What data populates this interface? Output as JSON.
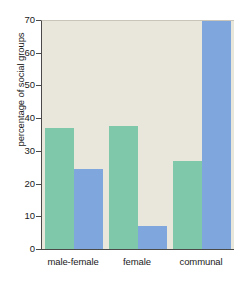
{
  "chart_data": {
    "type": "bar",
    "title": "",
    "xlabel": "",
    "ylabel": "percentage of social groups",
    "categories": [
      "male-female",
      "female",
      "communal"
    ],
    "ylim": [
      0,
      70
    ],
    "yticks": [
      0,
      10,
      20,
      30,
      40,
      50,
      60,
      70
    ],
    "ytick_labels": [
      "0",
      "10",
      "20",
      "30",
      "40",
      "50",
      "60",
      "70"
    ],
    "grid": false,
    "legend": "none",
    "series": [
      {
        "name": "green-series",
        "color": "#7fc8a9",
        "values": [
          37.3,
          37.9,
          27.2
        ]
      },
      {
        "name": "blue-series",
        "color": "#7fa7dd",
        "values": [
          24.8,
          7.3,
          70.0
        ]
      }
    ],
    "colors": {
      "plot_background": "#e9e6dc",
      "page_background": "#ffffff",
      "axis": "#4a4a48",
      "text": "#1a1a1a",
      "green": "#7fc8a9",
      "blue": "#7fa7dd"
    }
  }
}
